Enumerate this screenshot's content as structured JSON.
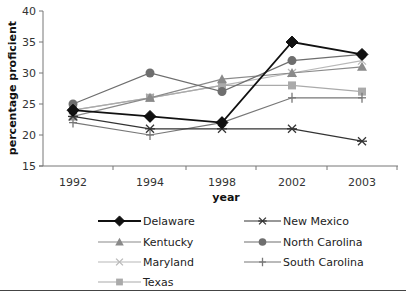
{
  "chart_data": {
    "type": "line",
    "title": "",
    "xlabel": "year",
    "ylabel": "percentage proficient",
    "ylim": [
      15,
      40
    ],
    "yticks": [
      15,
      20,
      25,
      30,
      35,
      40
    ],
    "categories": [
      "1992",
      "1994",
      "1998",
      "2002",
      "2003"
    ],
    "grid": false,
    "legend_position": "bottom",
    "series": [
      {
        "name": "Delaware",
        "marker": "diamond",
        "color": "#111111",
        "values": [
          24,
          23,
          22,
          35,
          33
        ]
      },
      {
        "name": "New Mexico",
        "marker": "asterisk",
        "color": "#333333",
        "values": [
          23,
          21,
          21,
          21,
          19
        ]
      },
      {
        "name": "Kentucky",
        "marker": "triangle",
        "color": "#8a8a8a",
        "values": [
          23,
          26,
          29,
          30,
          31
        ]
      },
      {
        "name": "North Carolina",
        "marker": "circle",
        "color": "#6e6e6e",
        "values": [
          25,
          30,
          27,
          32,
          33
        ]
      },
      {
        "name": "Maryland",
        "marker": "x",
        "color": "#b8b8b8",
        "values": [
          24,
          26,
          28,
          30,
          32
        ]
      },
      {
        "name": "South Carolina",
        "marker": "plus",
        "color": "#777777",
        "values": [
          22,
          20,
          22,
          26,
          26
        ]
      },
      {
        "name": "Texas",
        "marker": "square",
        "color": "#aaaaaa",
        "values": [
          24,
          26,
          28,
          28,
          27
        ]
      }
    ]
  }
}
